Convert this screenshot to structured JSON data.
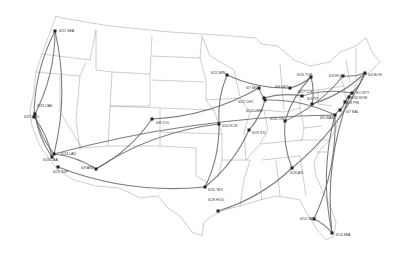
{
  "map": {
    "type": "US route map",
    "colors": {
      "background": "#ffffff",
      "borders": "#9a9a9a",
      "routes": "#666666",
      "markers": "#222222",
      "label": "#333333"
    },
    "stops": [
      {
        "id": "SEA",
        "label": "6/21 SEA",
        "x": 55,
        "y": 31,
        "lx": 59,
        "ly": 29
      },
      {
        "id": "OAK",
        "label": "6/23 OAK",
        "x": 35,
        "y": 114,
        "lx": 37,
        "ly": 104
      },
      {
        "id": "SFO",
        "label": "6/22 SFO",
        "x": 34,
        "y": 117,
        "lx": 24,
        "ly": 115
      },
      {
        "id": "LAD",
        "label": "6/24 LAD",
        "x": 54,
        "y": 154,
        "lx": 61,
        "ly": 152
      },
      {
        "id": "LAA",
        "label": "6/26 LAA",
        "x": 52,
        "y": 157,
        "lx": 43,
        "ly": 158
      },
      {
        "id": "SDP",
        "label": "6/25 SDP",
        "x": 58,
        "y": 167,
        "lx": 53,
        "ly": 170
      },
      {
        "id": "ARZ",
        "label": "6/9 ARZ",
        "x": 96,
        "y": 169,
        "lx": 81,
        "ly": 166
      },
      {
        "id": "COL",
        "label": "6/8 COL",
        "x": 152,
        "y": 119,
        "lx": 156,
        "ly": 121
      },
      {
        "id": "MIN",
        "label": "6/11 MIN",
        "x": 227,
        "y": 75,
        "lx": 211,
        "ly": 71
      },
      {
        "id": "KCR",
        "label": "6/10 KCR",
        "x": 219,
        "y": 124,
        "lx": 222,
        "ly": 124
      },
      {
        "id": "TEX",
        "label": "6/20 TEX",
        "x": 205,
        "y": 187,
        "lx": 208,
        "ly": 188
      },
      {
        "id": "HOU",
        "label": "6/28 HOU",
        "x": 218,
        "y": 211,
        "lx": 208,
        "ly": 198
      },
      {
        "id": "STL",
        "label": "6/19 STL",
        "x": 249,
        "y": 130,
        "lx": 252,
        "ly": 131
      },
      {
        "id": "MIL",
        "label": "6/7 MIL",
        "x": 259,
        "y": 88,
        "lx": 246,
        "ly": 86
      },
      {
        "id": "CHC",
        "label": "6/12 CHC",
        "x": 264,
        "y": 98,
        "lx": 238,
        "ly": 100
      },
      {
        "id": "CHW",
        "label": "6/13 CHW",
        "x": 265,
        "y": 100,
        "lx": 246,
        "ly": 109
      },
      {
        "id": "CIN",
        "label": "6/14 CIN",
        "x": 285,
        "y": 121,
        "lx": 270,
        "ly": 117
      },
      {
        "id": "DET",
        "label": "6/6 DET",
        "x": 290,
        "y": 88,
        "lx": 275,
        "ly": 85
      },
      {
        "id": "TOR",
        "label": "6/16 TOR",
        "x": 311,
        "y": 77,
        "lx": 297,
        "ly": 73
      },
      {
        "id": "CLE",
        "label": "6/17 CLE",
        "x": 302,
        "y": 96,
        "lx": 298,
        "ly": 90
      },
      {
        "id": "PIT",
        "label": "6/2 PIT",
        "x": 312,
        "y": 104,
        "lx": 307,
        "ly": 97
      },
      {
        "id": "HOU2",
        "label": "6/3 HOU",
        "x": 343,
        "y": 76,
        "lx": 329,
        "ly": 74
      },
      {
        "id": "BOS",
        "label": "6/4 BOS",
        "x": 365,
        "y": 73,
        "lx": 368,
        "ly": 73
      },
      {
        "id": "NYY",
        "label": "6/1 NYY",
        "x": 352,
        "y": 93,
        "lx": 356,
        "ly": 91
      },
      {
        "id": "NYM",
        "label": "6/30 NYM",
        "x": 349,
        "y": 97,
        "lx": 351,
        "ly": 96
      },
      {
        "id": "PHI",
        "label": "6/3 PHI",
        "x": 345,
        "y": 102,
        "lx": 347,
        "ly": 101
      },
      {
        "id": "BAL",
        "label": "6/7 BAL",
        "x": 340,
        "y": 110,
        "lx": 346,
        "ly": 110
      },
      {
        "id": "WAS",
        "label": "6/5 WAS",
        "x": 335,
        "y": 115,
        "lx": 320,
        "ly": 116
      },
      {
        "id": "ATL",
        "label": "6/26 ATL",
        "x": 292,
        "y": 168,
        "lx": 290,
        "ly": 171
      },
      {
        "id": "TAM",
        "label": "6/13 TAM",
        "x": 314,
        "y": 219,
        "lx": 300,
        "ly": 217
      },
      {
        "id": "MIA",
        "label": "6/14 MIA",
        "x": 332,
        "y": 233,
        "lx": 336,
        "ly": 233
      }
    ],
    "routes": [
      [
        "SEA",
        "OAK"
      ],
      [
        "SEA",
        "SFO"
      ],
      [
        "SEA",
        "LAD"
      ],
      [
        "OAK",
        "LAD"
      ],
      [
        "SFO",
        "LAA"
      ],
      [
        "OAK",
        "LAA"
      ],
      [
        "LAD",
        "ARZ"
      ],
      [
        "SDP",
        "TEX"
      ],
      [
        "LAD",
        "WAS"
      ],
      [
        "ARZ",
        "COL"
      ],
      [
        "ARZ",
        "KCR"
      ],
      [
        "COL",
        "MIL"
      ],
      [
        "KCR",
        "MIN"
      ],
      [
        "MIN",
        "DET"
      ],
      [
        "KCR",
        "TEX"
      ],
      [
        "STL",
        "CHW"
      ],
      [
        "STL",
        "TEX"
      ],
      [
        "HOU",
        "ATL"
      ],
      [
        "ATL",
        "CIN"
      ],
      [
        "ATL",
        "BOS"
      ],
      [
        "CIN",
        "TOR"
      ],
      [
        "MIL",
        "CHC"
      ],
      [
        "CHC",
        "CLE"
      ],
      [
        "DET",
        "TOR"
      ],
      [
        "TOR",
        "PIT"
      ],
      [
        "PIT",
        "BOS"
      ],
      [
        "CLE",
        "NYY"
      ],
      [
        "HOU2",
        "BOS"
      ],
      [
        "BOS",
        "NYY"
      ],
      [
        "NYY",
        "PHI"
      ],
      [
        "PHI",
        "BAL"
      ],
      [
        "BAL",
        "WAS"
      ],
      [
        "WAS",
        "TAM"
      ],
      [
        "WAS",
        "MIA"
      ],
      [
        "TAM",
        "MIA"
      ],
      [
        "NYM",
        "MIA"
      ],
      [
        "CHW",
        "WAS"
      ],
      [
        "CIN",
        "HOU2"
      ]
    ]
  }
}
